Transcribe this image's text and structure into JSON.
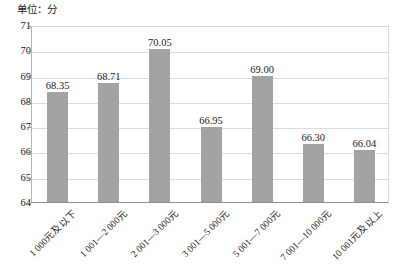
{
  "chart_data": {
    "type": "bar",
    "title": "单位：分",
    "xlabel": "",
    "ylabel": "",
    "ylim": [
      64,
      71
    ],
    "ytick_step": 1,
    "yticks": [
      "71",
      "70",
      "69",
      "68",
      "67",
      "66",
      "65",
      "64"
    ],
    "grid": true,
    "legend": false,
    "bar_color": "#a3a3a3",
    "gridline_color": "#dcdcdc",
    "axis_color": "#8f8f8f",
    "categories": [
      "1 000元及以下",
      "1 001—2 000元",
      "2 001—3 000元",
      "3 001—5 000元",
      "5 001—7 000元",
      "7 001—10 000元",
      "10 001元及以上"
    ],
    "values": [
      68.35,
      68.71,
      70.05,
      66.95,
      69.0,
      66.3,
      66.04
    ],
    "value_labels": [
      "68.35",
      "68.71",
      "70.05",
      "66.95",
      "69.00",
      "66.30",
      "66.04"
    ]
  }
}
